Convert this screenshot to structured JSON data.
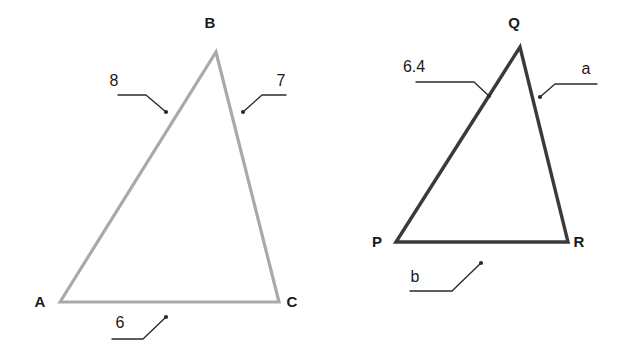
{
  "figure": {
    "background_color": "#ffffff",
    "label_color": "#1a1a1a",
    "leader_color": "#2b2b2b"
  },
  "triangles": [
    {
      "id": "ABC",
      "name": "triangle-abc",
      "stroke_color": "#a9a9a9",
      "stroke_width": 3.2,
      "vertices": [
        {
          "name": "A",
          "x": 60,
          "y": 302,
          "label_x": 40,
          "label_y": 307
        },
        {
          "name": "B",
          "x": 216,
          "y": 52,
          "label_x": 210,
          "label_y": 28
        },
        {
          "name": "C",
          "x": 279,
          "y": 302,
          "label_x": 292,
          "label_y": 307
        }
      ],
      "sides": [
        {
          "name": "AB",
          "label": "8",
          "label_x": 114,
          "label_y": 86,
          "leader_points": "118,95 146,95 166,112",
          "dot_x": 166,
          "dot_y": 112
        },
        {
          "name": "BC",
          "label": "7",
          "label_x": 281,
          "label_y": 86,
          "leader_points": "286,95 262,95 243,112",
          "dot_x": 243,
          "dot_y": 112
        },
        {
          "name": "AC",
          "label": "6",
          "label_x": 120,
          "label_y": 328,
          "leader_points": "112,339 143,339 166,317",
          "dot_x": 166,
          "dot_y": 317
        }
      ]
    },
    {
      "id": "PQR",
      "name": "triangle-pqr",
      "stroke_color": "#3a3a3a",
      "stroke_width": 3.4,
      "vertices": [
        {
          "name": "P",
          "x": 396,
          "y": 242,
          "label_x": 377,
          "label_y": 247
        },
        {
          "name": "Q",
          "x": 520,
          "y": 47,
          "label_x": 514,
          "label_y": 28
        },
        {
          "name": "R",
          "x": 568,
          "y": 242,
          "label_x": 579,
          "label_y": 247
        }
      ],
      "sides": [
        {
          "name": "PQ",
          "label": "6.4",
          "label_x": 414,
          "label_y": 72,
          "leader_points": "416,82 474,82 489,96",
          "dot_x": 489,
          "dot_y": 96
        },
        {
          "name": "QR",
          "label": "a",
          "label_x": 586,
          "label_y": 74,
          "leader_points": "597,84 555,84 540,97",
          "dot_x": 540,
          "dot_y": 97
        },
        {
          "name": "PR",
          "label": "b",
          "label_x": 415,
          "label_y": 282,
          "leader_points": "410,291 452,291 481,263",
          "dot_x": 481,
          "dot_y": 263
        }
      ]
    }
  ]
}
